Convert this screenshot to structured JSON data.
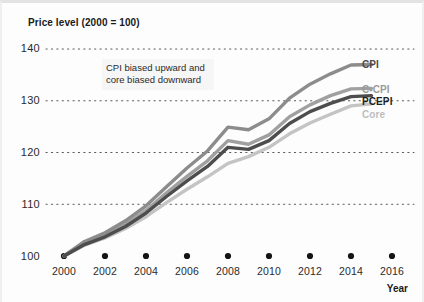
{
  "chart": {
    "title": "Price level (2000 = 100)",
    "annotation": "CPI biased upward and core biased downward",
    "axis_year_label": "Year"
  },
  "chart_data": {
    "type": "line",
    "title": "Price level (2000 = 100)",
    "xlabel": "Year",
    "ylabel": "Price level (2000 = 100)",
    "xlim": [
      2000,
      2016
    ],
    "ylim": [
      100,
      140
    ],
    "yticks": [
      100,
      110,
      120,
      130,
      140
    ],
    "xticks": [
      2000,
      2002,
      2004,
      2006,
      2008,
      2010,
      2012,
      2014,
      2016
    ],
    "grid": "horizontal-dotted",
    "legend_position": "right-inline",
    "annotations": [
      {
        "text": "CPI biased upward and core biased downward",
        "x": 2004.5,
        "y": 136.5
      }
    ],
    "x": [
      2000,
      2001,
      2002,
      2003,
      2004,
      2005,
      2006,
      2007,
      2008,
      2009,
      2010,
      2011,
      2012,
      2013,
      2014,
      2015
    ],
    "series": [
      {
        "name": "CPI",
        "color": "#8c8c8c",
        "values": [
          100.0,
          102.8,
          104.5,
          106.8,
          109.7,
          113.4,
          117.0,
          120.3,
          124.9,
          124.4,
          126.5,
          130.5,
          133.2,
          135.2,
          136.9,
          137.0
        ]
      },
      {
        "name": "C-CPI",
        "color": "#a0a0a0",
        "values": [
          100.0,
          102.5,
          104.0,
          106.1,
          108.8,
          112.2,
          115.4,
          118.4,
          122.3,
          121.6,
          123.4,
          126.9,
          129.2,
          131.0,
          132.3,
          132.4
        ]
      },
      {
        "name": "PCEPI",
        "color": "#4d4d4d",
        "values": [
          100.0,
          102.2,
          103.7,
          105.7,
          108.3,
          111.5,
          114.5,
          117.3,
          121.0,
          120.6,
          122.3,
          125.6,
          127.9,
          129.5,
          130.8,
          131.0
        ]
      },
      {
        "name": "Core",
        "color": "#c4c4c4",
        "values": [
          100.0,
          102.1,
          103.5,
          105.3,
          107.6,
          110.3,
          112.9,
          115.3,
          117.9,
          119.2,
          121.0,
          123.6,
          125.7,
          127.4,
          129.0,
          129.4
        ]
      }
    ]
  },
  "ytick_labels": [
    "140",
    "130",
    "120",
    "110",
    "100"
  ],
  "xtick_labels": [
    "2000",
    "2002",
    "2004",
    "2006",
    "2008",
    "2010",
    "2012",
    "2014",
    "2016"
  ],
  "series_labels": [
    {
      "label": "CPI",
      "color": "#4a4a4a"
    },
    {
      "label": "C-CPI",
      "color": "#9a9a9a"
    },
    {
      "label": "PCEPI",
      "color": "#1f1f1f"
    },
    {
      "label": "Core",
      "color": "#bdbdbd"
    }
  ]
}
